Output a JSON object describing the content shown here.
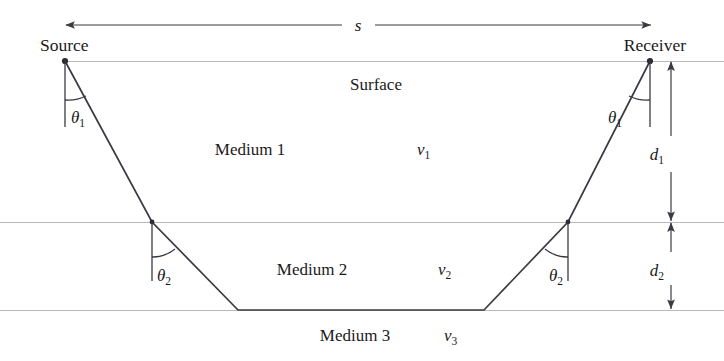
{
  "figure": {
    "type": "seismic-refraction-ray-diagram",
    "endpoints": {
      "source_label": "Source",
      "receiver_label": "Receiver"
    },
    "surface_label": "Surface",
    "offset": {
      "symbol": "s",
      "description": "source-to-receiver offset arrow"
    },
    "layers": [
      {
        "name_label": "Medium 1",
        "velocity_symbol": "v",
        "velocity_subscript": "1",
        "thickness_symbol": "d",
        "thickness_subscript": "1",
        "angle_symbol": "θ",
        "angle_subscript": "1"
      },
      {
        "name_label": "Medium 2",
        "velocity_symbol": "v",
        "velocity_subscript": "2",
        "thickness_symbol": "d",
        "thickness_subscript": "2",
        "angle_symbol": "θ",
        "angle_subscript": "2"
      },
      {
        "name_label": "Medium 3",
        "velocity_symbol": "v",
        "velocity_subscript": "3"
      }
    ],
    "colors": {
      "ray": "#3a3a42",
      "boundary": "#b9b9bd",
      "text": "#1a1a1a",
      "background": "#ffffff"
    }
  }
}
